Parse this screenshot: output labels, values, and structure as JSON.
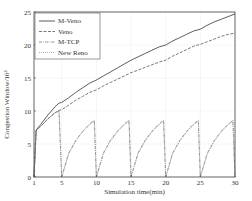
{
  "chart_data": {
    "type": "line",
    "title": "",
    "xlabel": "Simulation time(min)",
    "ylabel": "Congestion Window/10³",
    "xlim": [
      1,
      30
    ],
    "ylim": [
      0,
      25
    ],
    "xticks": [
      1,
      5,
      10,
      15,
      20,
      25,
      30
    ],
    "yticks": [
      0,
      5,
      10,
      15,
      20,
      25
    ],
    "grid": true,
    "legend_position": "upper left",
    "series": [
      {
        "name": "M-Veno",
        "style": "solid",
        "color": "#333333",
        "points": [
          [
            1,
            0
          ],
          [
            1.3,
            7.1
          ],
          [
            2,
            8.0
          ],
          [
            3,
            9.4
          ],
          [
            4,
            10.6
          ],
          [
            4.6,
            11.2
          ],
          [
            5,
            11.3
          ],
          [
            6,
            12.0
          ],
          [
            7,
            12.8
          ],
          [
            8,
            13.5
          ],
          [
            9,
            14.2
          ],
          [
            10,
            14.7
          ],
          [
            11,
            15.3
          ],
          [
            12,
            15.9
          ],
          [
            13,
            16.5
          ],
          [
            14,
            17.1
          ],
          [
            15,
            17.7
          ],
          [
            16,
            18.2
          ],
          [
            17,
            18.7
          ],
          [
            18,
            19.2
          ],
          [
            19,
            19.7
          ],
          [
            20,
            20.0
          ],
          [
            21,
            20.6
          ],
          [
            22,
            21.1
          ],
          [
            23,
            21.6
          ],
          [
            24,
            22.1
          ],
          [
            25,
            22.4
          ],
          [
            26,
            23.0
          ],
          [
            27,
            23.5
          ],
          [
            28,
            23.9
          ],
          [
            29,
            24.3
          ],
          [
            30,
            24.7
          ]
        ]
      },
      {
        "name": "Veno",
        "style": "dashed",
        "color": "#555555",
        "points": [
          [
            1,
            0
          ],
          [
            1.3,
            7.0
          ],
          [
            2,
            7.7
          ],
          [
            3,
            8.8
          ],
          [
            4,
            9.7
          ],
          [
            4.6,
            10.1
          ],
          [
            5,
            10.2
          ],
          [
            6,
            10.9
          ],
          [
            7,
            11.6
          ],
          [
            8,
            12.2
          ],
          [
            9,
            12.8
          ],
          [
            10,
            13.2
          ],
          [
            11,
            13.8
          ],
          [
            12,
            14.3
          ],
          [
            13,
            14.8
          ],
          [
            14,
            15.3
          ],
          [
            15,
            15.8
          ],
          [
            16,
            16.2
          ],
          [
            17,
            16.6
          ],
          [
            18,
            17.0
          ],
          [
            19,
            17.4
          ],
          [
            20,
            17.7
          ],
          [
            21,
            18.3
          ],
          [
            22,
            18.8
          ],
          [
            23,
            19.3
          ],
          [
            24,
            19.8
          ],
          [
            25,
            20.1
          ],
          [
            26,
            20.5
          ],
          [
            27,
            20.9
          ],
          [
            28,
            21.3
          ],
          [
            29,
            21.6
          ],
          [
            30,
            21.8
          ]
        ]
      },
      {
        "name": "M-TCP",
        "style": "dashdot",
        "color": "#777777",
        "points": [
          [
            1,
            0
          ],
          [
            1.3,
            7.0
          ],
          [
            2,
            7.7
          ],
          [
            3,
            8.8
          ],
          [
            4,
            9.7
          ],
          [
            4.6,
            10.0
          ],
          [
            5,
            0
          ],
          [
            6,
            3.6
          ],
          [
            7,
            5.5
          ],
          [
            8,
            6.9
          ],
          [
            9,
            8.0
          ],
          [
            9.7,
            8.6
          ],
          [
            10,
            0
          ],
          [
            11,
            3.6
          ],
          [
            12,
            5.5
          ],
          [
            13,
            6.9
          ],
          [
            14,
            8.0
          ],
          [
            14.7,
            8.6
          ],
          [
            15,
            0
          ],
          [
            16,
            3.6
          ],
          [
            17,
            5.5
          ],
          [
            18,
            6.9
          ],
          [
            19,
            8.0
          ],
          [
            19.7,
            8.6
          ],
          [
            20,
            0
          ],
          [
            21,
            3.6
          ],
          [
            22,
            5.5
          ],
          [
            23,
            6.9
          ],
          [
            24,
            8.0
          ],
          [
            24.7,
            8.6
          ],
          [
            25,
            0
          ],
          [
            26,
            3.6
          ],
          [
            27,
            5.5
          ],
          [
            28,
            6.9
          ],
          [
            29,
            8.0
          ],
          [
            29.7,
            8.6
          ],
          [
            30,
            0
          ]
        ]
      },
      {
        "name": "New Reno",
        "style": "dotted",
        "color": "#999999",
        "points": [
          [
            1,
            0
          ],
          [
            1.3,
            7.0
          ],
          [
            2,
            7.7
          ],
          [
            3,
            8.8
          ],
          [
            4,
            9.7
          ],
          [
            4.6,
            10.0
          ],
          [
            5,
            0
          ],
          [
            6,
            3.5
          ],
          [
            7,
            5.4
          ],
          [
            8,
            6.8
          ],
          [
            9,
            7.9
          ],
          [
            9.7,
            8.5
          ],
          [
            10,
            0
          ],
          [
            11,
            3.5
          ],
          [
            12,
            5.4
          ],
          [
            13,
            6.8
          ],
          [
            14,
            7.9
          ],
          [
            14.7,
            8.5
          ],
          [
            15,
            0
          ],
          [
            16,
            3.5
          ],
          [
            17,
            5.4
          ],
          [
            18,
            6.8
          ],
          [
            19,
            7.9
          ],
          [
            19.7,
            8.5
          ],
          [
            20,
            0
          ],
          [
            21,
            3.5
          ],
          [
            22,
            5.4
          ],
          [
            23,
            6.8
          ],
          [
            24,
            7.9
          ],
          [
            24.7,
            8.5
          ],
          [
            25,
            0
          ],
          [
            26,
            3.5
          ],
          [
            27,
            5.4
          ],
          [
            28,
            6.8
          ],
          [
            29,
            7.9
          ],
          [
            29.7,
            8.5
          ],
          [
            30,
            0
          ]
        ]
      }
    ]
  },
  "layout": {
    "plot_left": 34,
    "plot_right": 235,
    "plot_top": 12,
    "plot_bottom": 177
  }
}
